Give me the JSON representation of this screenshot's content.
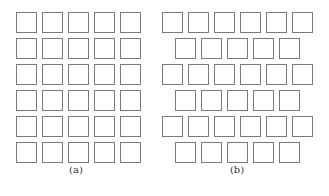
{
  "figure": {
    "panels": [
      {
        "id": "a",
        "caption": "(a)",
        "layout": "aligned grid",
        "rows": 6,
        "cols_per_row": [
          5,
          5,
          5,
          5,
          5,
          5
        ],
        "row_offsets": [
          0,
          0,
          0,
          0,
          0,
          0
        ]
      },
      {
        "id": "b",
        "caption": "(b)",
        "layout": "staggered grid",
        "rows": 6,
        "cols_per_row": [
          6,
          5,
          6,
          5,
          6,
          5
        ],
        "row_offsets": [
          0,
          13,
          0,
          13,
          0,
          13
        ]
      }
    ],
    "square_color": "#7a7a7a",
    "background": "#ffffff"
  }
}
